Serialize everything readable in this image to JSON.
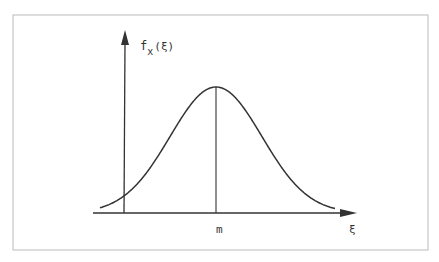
{
  "figure": {
    "y_axis_label": "f",
    "y_axis_subscript": "x",
    "y_axis_arg": "(ξ)",
    "x_axis_label": "ξ",
    "mean_label": "m"
  },
  "colors": {
    "ink": "#333333",
    "frame": "#bbbbbb",
    "background": "#ffffff"
  },
  "chart_data": {
    "type": "line",
    "title": "",
    "xlabel": "ξ",
    "ylabel": "f_x(ξ)",
    "annotations": [
      {
        "text": "m",
        "position": "x-axis at curve peak",
        "marker": "vertical line from axis to peak"
      }
    ],
    "grid": false,
    "series": [
      {
        "name": "f_x(ξ)",
        "shape": "bell curve",
        "peak_at": "m"
      }
    ]
  }
}
